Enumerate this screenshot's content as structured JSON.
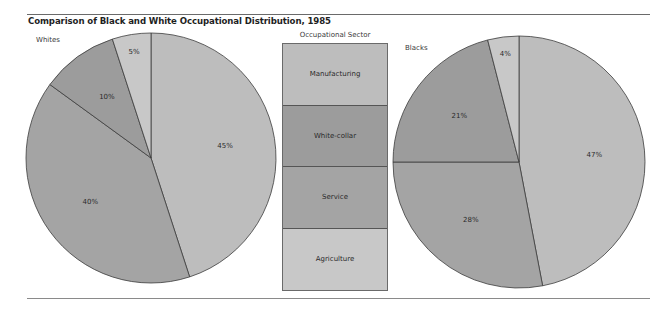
{
  "title": "Comparison of Black and White Occupational Distribution, 1985",
  "legend": {
    "title": "Occupational Sector",
    "items": [
      {
        "label": "Manufacturing",
        "color": "#bdbdbd"
      },
      {
        "label": "White-collar",
        "color": "#9c9c9c"
      },
      {
        "label": "Service",
        "color": "#a4a4a4"
      },
      {
        "label": "Agriculture",
        "color": "#c8c8c8"
      }
    ]
  },
  "pies": [
    {
      "label": "Whites",
      "slices": [
        {
          "sector": "Manufacturing",
          "value": 45,
          "label": "45%"
        },
        {
          "sector": "Service",
          "value": 40,
          "label": "40%"
        },
        {
          "sector": "White-collar",
          "value": 10,
          "label": "10%"
        },
        {
          "sector": "Agriculture",
          "value": 5,
          "label": "5%"
        }
      ]
    },
    {
      "label": "Blacks",
      "slices": [
        {
          "sector": "Manufacturing",
          "value": 47,
          "label": "47%"
        },
        {
          "sector": "Service",
          "value": 28,
          "label": "28%"
        },
        {
          "sector": "White-collar",
          "value": 21,
          "label": "21%"
        },
        {
          "sector": "Agriculture",
          "value": 4,
          "label": "4%"
        }
      ]
    }
  ],
  "chart_data": [
    {
      "type": "pie",
      "title": "Comparison of Black and White Occupational Distribution, 1985",
      "subtitle": "Whites",
      "categories": [
        "Manufacturing",
        "Service",
        "White-collar",
        "Agriculture"
      ],
      "values": [
        45,
        40,
        10,
        5
      ],
      "unit": "%",
      "legend_title": "Occupational Sector",
      "legend_position": "center"
    },
    {
      "type": "pie",
      "title": "Comparison of Black and White Occupational Distribution, 1985",
      "subtitle": "Blacks",
      "categories": [
        "Manufacturing",
        "Service",
        "White-collar",
        "Agriculture"
      ],
      "values": [
        47,
        28,
        21,
        4
      ],
      "unit": "%",
      "legend_title": "Occupational Sector",
      "legend_position": "center"
    }
  ]
}
